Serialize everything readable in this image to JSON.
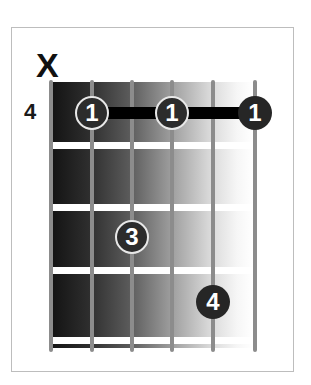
{
  "diagram": {
    "type": "guitar-chord-diagram",
    "muted_marker": "X",
    "start_fret_label": "4",
    "strings": 6,
    "frets_shown": 4,
    "colors": {
      "frame": "#bdbdbd",
      "string": "#8c8c8c",
      "fret": "#ffffff",
      "dot": "#2c2c2c",
      "barre": "#000000",
      "gradient_dark": "#141414",
      "gradient_light": "#ffffff"
    },
    "fingers": [
      {
        "label": "1",
        "string": 2,
        "fret": 1
      },
      {
        "label": "1",
        "string": 4,
        "fret": 1
      },
      {
        "label": "1",
        "string": 6,
        "fret": 1
      },
      {
        "label": "3",
        "string": 3,
        "fret": 3
      },
      {
        "label": "4",
        "string": 5,
        "fret": 4
      }
    ],
    "barre": {
      "fret": 1,
      "from_string": 2,
      "to_string": 6
    }
  }
}
